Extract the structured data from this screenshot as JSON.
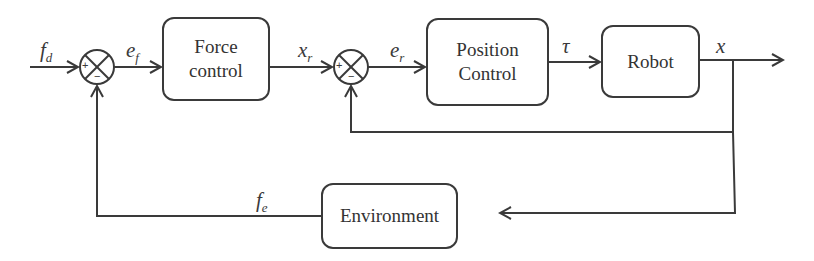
{
  "diagram": {
    "type": "control-block-diagram",
    "blocks": {
      "force_control": "Force\ncontrol",
      "position_control": "Position\nControl",
      "robot": "Robot",
      "environment": "Environment"
    },
    "summing_junctions": {
      "force_sum": {
        "plus": "+",
        "minus": "−"
      },
      "position_sum": {
        "plus": "+",
        "minus": "−"
      }
    },
    "signals": {
      "fd": {
        "base": "f",
        "sub": "d"
      },
      "ef": {
        "base": "e",
        "sub": "f"
      },
      "xr": {
        "base": "x",
        "sub": "r"
      },
      "er": {
        "base": "e",
        "sub": "r"
      },
      "tau": {
        "base": "τ"
      },
      "x": {
        "base": "x"
      },
      "fe": {
        "base": "f",
        "sub": "e"
      }
    },
    "colors": {
      "line": "#3a3a3a",
      "background": "#ffffff"
    }
  }
}
